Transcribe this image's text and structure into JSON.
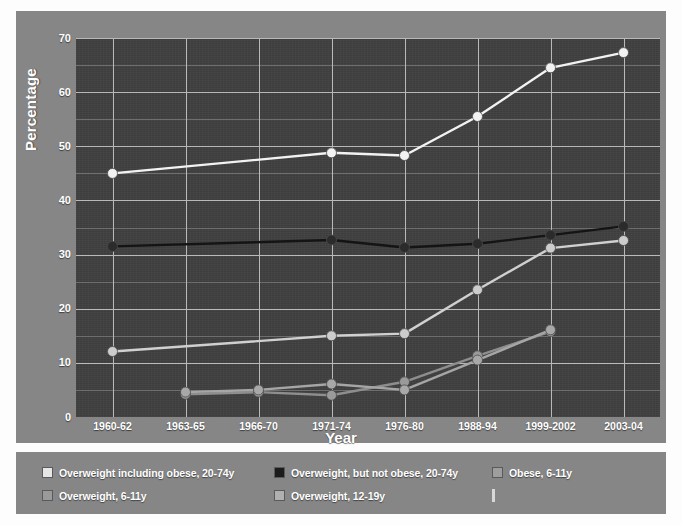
{
  "chart_data": {
    "type": "line",
    "title": "",
    "xlabel": "Year",
    "ylabel": "Percentage",
    "categories": [
      "1960-62",
      "1963-65",
      "1966-70",
      "1971-74",
      "1976-80",
      "1988-94",
      "1999-2002",
      "2003-04"
    ],
    "ylim": [
      0,
      70
    ],
    "yticks": [
      0,
      10,
      20,
      30,
      40,
      50,
      60,
      70
    ],
    "ytick_labels": [
      "0",
      "10",
      "20",
      "30",
      "40",
      "50",
      "60",
      "70"
    ],
    "grid": true,
    "minor_grid": true,
    "minor_tick_step": 5,
    "legend_position": "below-chart",
    "series": [
      {
        "name": "Overweight including obese, 20-74y",
        "color": "#f2f2f2",
        "marker_color": "#f2f2f2",
        "values": [
          45.0,
          null,
          null,
          48.8,
          48.3,
          55.5,
          64.5,
          67.3
        ]
      },
      {
        "name": "Overweight, but not obese, 20-74y",
        "color": "#141414",
        "marker_color": "#2b2b2b",
        "values": [
          31.5,
          null,
          null,
          32.7,
          31.3,
          32.0,
          33.6,
          35.2
        ]
      },
      {
        "name": "Obese, 6-11y",
        "color": "#8e8e8e",
        "marker_color": "#9a9a9a",
        "values": [
          null,
          4.2,
          4.6,
          4.0,
          6.5,
          11.3,
          15.8,
          null
        ]
      },
      {
        "name": "Overweight, 6-11y",
        "color": "#d0d0d0",
        "marker_color": "#cccccc",
        "values": [
          12.1,
          null,
          null,
          15.0,
          15.4,
          23.5,
          31.2,
          32.6
        ]
      },
      {
        "name": "Overweight, 12-19y",
        "color": "#a6a6a6",
        "marker_color": "#a8a8a8",
        "values": [
          null,
          4.6,
          5.0,
          6.1,
          5.0,
          10.5,
          16.1,
          null
        ]
      }
    ]
  },
  "legend": {
    "entries": [
      {
        "label": "Overweight including obese, 20-74y",
        "swatch": "#e6e6e6",
        "style": "box"
      },
      {
        "label": "Overweight, but not obese, 20-74y",
        "swatch": "#1c1c1c",
        "style": "box"
      },
      {
        "label": "Obese, 6-11y",
        "swatch": "#9e9e9e",
        "style": "box"
      },
      {
        "label": "Overweight, 6-11y",
        "swatch": "#9a9a9a",
        "style": "box"
      },
      {
        "label": "Overweight, 12-19y",
        "swatch": "#b0b0b0",
        "style": "box"
      },
      {
        "label": "",
        "swatch": "#d8d8d8",
        "style": "thin"
      }
    ]
  },
  "colors": {
    "page_background": "#ffffff",
    "panel_background": "#868686",
    "plot_background": "#3f3f3f",
    "gridline": "#b9b9b9",
    "minor_gridline": "#6e6e6e",
    "text": "#ffffff"
  }
}
